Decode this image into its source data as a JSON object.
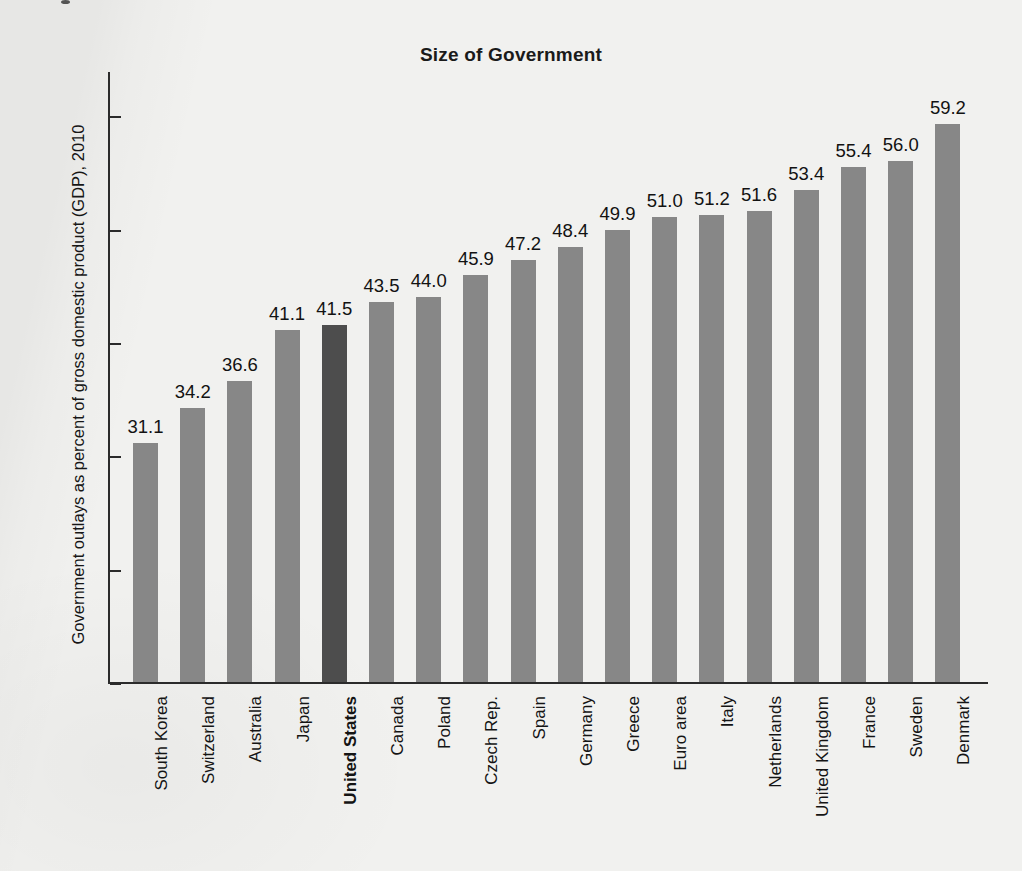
{
  "chart_data": {
    "type": "bar",
    "title": "Size of Government",
    "xlabel": "",
    "ylabel": "Government outlays as percent of gross domestic product (GDP), 2010",
    "ylim": [
      10,
      64
    ],
    "yticks": [
      10,
      20,
      30,
      40,
      50,
      60
    ],
    "ytick_labels": [
      "10",
      "20",
      "30",
      "40",
      "50",
      "60"
    ],
    "grid": false,
    "legend": null,
    "highlight_category": "United States",
    "highlight_color": "#4d4d4d",
    "bar_color": "#878787",
    "categories": [
      "South Korea",
      "Switzerland",
      "Australia",
      "Japan",
      "United States",
      "Canada",
      "Poland",
      "Czech Rep.",
      "Spain",
      "Germany",
      "Greece",
      "Euro area",
      "Italy",
      "Netherlands",
      "United Kingdom",
      "France",
      "Sweden",
      "Denmark"
    ],
    "values": [
      31.1,
      34.2,
      36.6,
      41.1,
      41.5,
      43.5,
      44.0,
      45.9,
      47.2,
      48.4,
      49.9,
      51.0,
      51.2,
      51.6,
      53.4,
      55.4,
      56.0,
      59.2
    ],
    "value_labels": [
      "31.1",
      "34.2",
      "36.6",
      "41.1",
      "41.5",
      "43.5",
      "44.0",
      "45.9",
      "47.2",
      "48.4",
      "49.9",
      "51.0",
      "51.2",
      "51.6",
      "53.4",
      "55.4",
      "56.0",
      "59.2"
    ]
  }
}
